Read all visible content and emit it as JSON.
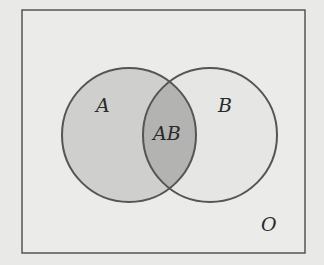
{
  "diagram": {
    "type": "venn",
    "universe": {
      "label": "O"
    },
    "sets": [
      {
        "name": "A",
        "label": "A",
        "fill": "#cfcfcd"
      },
      {
        "name": "B",
        "label": "B",
        "fill": "#e6e6e4"
      }
    ],
    "intersection": {
      "label": "AB",
      "fill": "#b3b3b1"
    },
    "colors": {
      "background": "#e9e9e7",
      "stroke": "#555555"
    }
  }
}
